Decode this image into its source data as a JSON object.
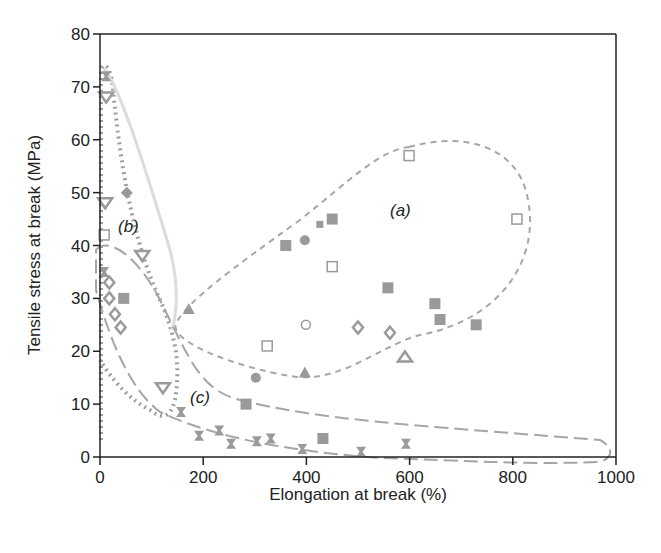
{
  "chart_data": {
    "type": "scatter",
    "title": "",
    "xlabel": "Elongation at break (%)",
    "ylabel": "Tensile stress at break (MPa)",
    "xlim": [
      0,
      1000
    ],
    "ylim": [
      0,
      80
    ],
    "xticks": [
      0,
      200,
      400,
      600,
      800,
      1000
    ],
    "yticks": [
      0,
      10,
      20,
      30,
      40,
      50,
      60,
      70,
      80
    ],
    "grid": false,
    "legend": null,
    "marker_color": "#9a9a9a",
    "regions": [
      {
        "label": "(a)",
        "label_pos": [
          590,
          47
        ],
        "outline": "short-dashed"
      },
      {
        "label": "(b)",
        "label_pos": [
          58,
          43
        ],
        "outline": "dotted"
      },
      {
        "label": "(c)",
        "label_pos": [
          175,
          12
        ],
        "outline": "long-dashed"
      }
    ],
    "series": [
      {
        "name": "open-square",
        "marker": "open-square",
        "points": [
          [
            599,
            57
          ],
          [
            808,
            45
          ],
          [
            450,
            36
          ],
          [
            324,
            21
          ],
          [
            8,
            42
          ]
        ]
      },
      {
        "name": "filled-square",
        "marker": "filled-square",
        "points": [
          [
            360,
            40
          ],
          [
            450,
            45
          ],
          [
            558,
            32
          ],
          [
            649,
            29
          ],
          [
            659,
            26
          ],
          [
            729,
            25
          ],
          [
            46,
            30
          ],
          [
            283,
            10
          ],
          [
            432,
            3.5
          ]
        ]
      },
      {
        "name": "small-filled-square",
        "marker": "small-filled-square",
        "points": [
          [
            426,
            44
          ]
        ]
      },
      {
        "name": "filled-circle",
        "marker": "filled-circle",
        "points": [
          [
            397,
            41
          ],
          [
            302,
            15
          ]
        ]
      },
      {
        "name": "open-circle",
        "marker": "open-circle",
        "points": [
          [
            399,
            25
          ]
        ]
      },
      {
        "name": "open-diamond",
        "marker": "open-diamond",
        "points": [
          [
            500,
            24.5
          ],
          [
            562,
            23.5
          ],
          [
            18,
            33
          ],
          [
            18,
            30
          ],
          [
            29,
            27
          ],
          [
            40,
            24.5
          ]
        ]
      },
      {
        "name": "filled-diamond",
        "marker": "filled-diamond",
        "points": [
          [
            52,
            50
          ]
        ]
      },
      {
        "name": "filled-triangle",
        "marker": "filled-triangle",
        "points": [
          [
            172,
            28
          ],
          [
            397,
            16
          ]
        ]
      },
      {
        "name": "open-triangle-up",
        "marker": "open-triangle-up",
        "points": [
          [
            591,
            19
          ]
        ]
      },
      {
        "name": "open-triangle-down",
        "marker": "open-triangle-down",
        "points": [
          [
            10,
            48
          ],
          [
            82,
            38
          ],
          [
            122,
            13
          ],
          [
            12,
            68
          ]
        ]
      },
      {
        "name": "hourglass",
        "marker": "hourglass",
        "points": [
          [
            157,
            8.5
          ],
          [
            192,
            4
          ],
          [
            231,
            5
          ],
          [
            254,
            2.5
          ],
          [
            304,
            3
          ],
          [
            331,
            3.5
          ],
          [
            392,
            1.5
          ],
          [
            506,
            1
          ],
          [
            593,
            2.5
          ],
          [
            12,
            72
          ],
          [
            8,
            35
          ]
        ]
      }
    ]
  }
}
